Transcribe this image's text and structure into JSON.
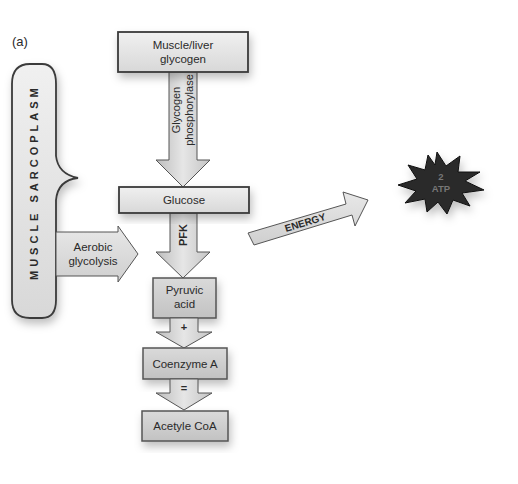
{
  "panel_label": "(a)",
  "container": {
    "label": "MUSCLE SARCOPLASM"
  },
  "nodes": {
    "glycogen": {
      "line1": "Muscle/liver",
      "line2": "glycogen"
    },
    "glucose": {
      "label": "Glucose"
    },
    "pyruvic": {
      "line1": "Pyruvic",
      "line2": "acid"
    },
    "coenzyme": {
      "label": "Coenzyme A"
    },
    "acetyl": {
      "label": "Acetyle CoA"
    }
  },
  "arrows": {
    "phosphorylase": {
      "line1": "Glycogen",
      "line2": "phosphorylase"
    },
    "pfk": {
      "label": "PFK"
    },
    "plus": {
      "label": "+"
    },
    "equals": {
      "label": "="
    },
    "aerobic": {
      "line1": "Aerobic",
      "line2": "glycolysis"
    },
    "energy": {
      "label": "ENERGY"
    }
  },
  "atp": {
    "line1": "2",
    "line2": "ATP"
  },
  "colors": {
    "box_fill": "#e4e4e4",
    "box_dark_fill": "#cfcfcf",
    "stroke": "#3a3a3a",
    "burst_fill": "#2b2b2b"
  }
}
